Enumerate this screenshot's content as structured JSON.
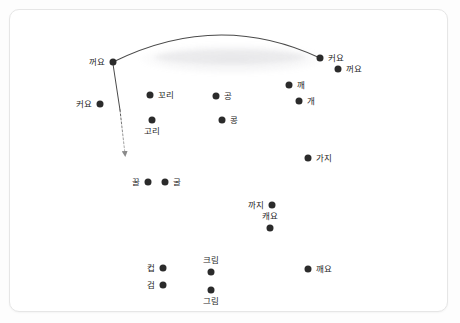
{
  "canvas": {
    "width": 460,
    "height": 323,
    "background_color": "#fdfdfd",
    "card_color": "#ffffff",
    "card_border_color": "#e6e6e6"
  },
  "chart_data": {
    "type": "scatter",
    "title": "",
    "subtitle": "",
    "xlabel": "",
    "ylabel": "",
    "grid": false,
    "legend": "none",
    "axis_ticks_visible": false,
    "point_color": "#2b2b2b",
    "point_radius": 3.5,
    "xlim": [
      0,
      460
    ],
    "ylim": [
      323,
      0
    ],
    "points": [
      {
        "label": "꺼요",
        "x": 113,
        "y": 62,
        "label_pos": "left"
      },
      {
        "label": "커요",
        "x": 100,
        "y": 104,
        "label_pos": "left"
      },
      {
        "label": "꼬리",
        "x": 150,
        "y": 95,
        "label_pos": "right"
      },
      {
        "label": "고리",
        "x": 152,
        "y": 120,
        "label_pos": "below"
      },
      {
        "label": "공",
        "x": 216,
        "y": 96,
        "label_pos": "right"
      },
      {
        "label": "콩",
        "x": 222,
        "y": 120,
        "label_pos": "right"
      },
      {
        "label": "커요",
        "x": 320,
        "y": 58,
        "label_pos": "right"
      },
      {
        "label": "꺼요",
        "x": 338,
        "y": 69,
        "label_pos": "right"
      },
      {
        "label": "깨",
        "x": 289,
        "y": 85,
        "label_pos": "right"
      },
      {
        "label": "개",
        "x": 299,
        "y": 101,
        "label_pos": "right"
      },
      {
        "label": "가지",
        "x": 308,
        "y": 158,
        "label_pos": "right"
      },
      {
        "label": "꿀",
        "x": 148,
        "y": 182,
        "label_pos": "left"
      },
      {
        "label": "굴",
        "x": 165,
        "y": 182,
        "label_pos": "right"
      },
      {
        "label": "까지",
        "x": 272,
        "y": 205,
        "label_pos": "left"
      },
      {
        "label": "캐요",
        "x": 270,
        "y": 228,
        "label_pos": "above"
      },
      {
        "label": "컵",
        "x": 163,
        "y": 268,
        "label_pos": "left"
      },
      {
        "label": "검",
        "x": 163,
        "y": 285,
        "label_pos": "left"
      },
      {
        "label": "크림",
        "x": 211,
        "y": 272,
        "label_pos": "above"
      },
      {
        "label": "그림",
        "x": 211,
        "y": 290,
        "label_pos": "below"
      },
      {
        "label": "깨요",
        "x": 308,
        "y": 269,
        "label_pos": "right"
      }
    ],
    "annotations": [
      {
        "name": "arc-connector",
        "kind": "curve",
        "style": "solid",
        "color": "#4a4a4a",
        "from_label": "꺼요",
        "to_label": "커요",
        "from": [
          113,
          62
        ],
        "to": [
          320,
          58
        ],
        "control": [
          218,
          12
        ]
      },
      {
        "name": "downward-arrow",
        "kind": "arrow",
        "style": "solid-to-dashed",
        "color": "#6e6e6e",
        "from_label": "꺼요",
        "from": [
          113,
          64
        ],
        "to": [
          125,
          160
        ]
      }
    ]
  }
}
